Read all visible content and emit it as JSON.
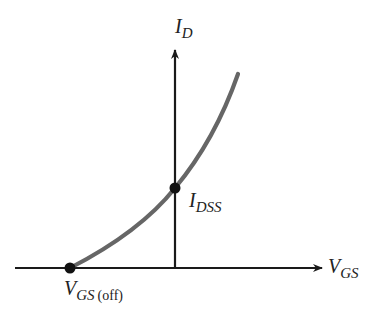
{
  "diagram": {
    "y_axis": {
      "label_main": "I",
      "label_sub": "D"
    },
    "x_axis": {
      "label_main": "V",
      "label_sub": "GS"
    },
    "points": [
      {
        "label_main": "I",
        "label_sub": "DSS",
        "label_suffix": ""
      },
      {
        "label_main": "V",
        "label_sub": "GS",
        "label_suffix": "(off)"
      }
    ],
    "colors": {
      "axis": "#1a1a1a",
      "curve": "#666666",
      "point": "#111111",
      "text": "#222222"
    }
  }
}
